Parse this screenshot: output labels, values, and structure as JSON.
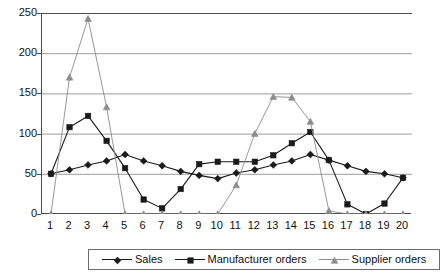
{
  "chart_data": {
    "type": "line",
    "title": "",
    "subtitle": "",
    "xlabel": "",
    "ylabel": "",
    "xlim": [
      1,
      20
    ],
    "ylim": [
      0,
      250
    ],
    "ytick_labels": [
      "0",
      "50",
      "100",
      "150",
      "200",
      "250"
    ],
    "yticks": [
      0,
      50,
      100,
      150,
      200,
      250
    ],
    "x": [
      1,
      2,
      3,
      4,
      5,
      6,
      7,
      8,
      9,
      10,
      11,
      12,
      13,
      14,
      15,
      16,
      17,
      18,
      19,
      20
    ],
    "xtick_labels": [
      "1",
      "2",
      "3",
      "4",
      "5",
      "6",
      "7",
      "8",
      "9",
      "10",
      "11",
      "12",
      "13",
      "14",
      "15",
      "16",
      "17",
      "18",
      "19",
      "20"
    ],
    "grid": "horizontal",
    "legend_position": "bottom",
    "series": [
      {
        "name": "Sales",
        "marker": "diamond",
        "color": "#1a1a1a",
        "values": [
          50,
          55,
          61,
          66,
          74,
          66,
          60,
          53,
          48,
          44,
          51,
          55,
          61,
          66,
          74,
          67,
          60,
          53,
          50,
          45
        ]
      },
      {
        "name": "Manufacturer orders",
        "marker": "square",
        "color": "#1a1a1a",
        "values": [
          50,
          108,
          122,
          91,
          57,
          18,
          7,
          31,
          62,
          65,
          65,
          65,
          73,
          88,
          102,
          67,
          12,
          0,
          13,
          45
        ]
      },
      {
        "name": "Supplier orders",
        "marker": "triangle",
        "color": "#8c8c8c",
        "values": [
          0,
          170,
          243,
          133,
          0,
          0,
          0,
          0,
          0,
          0,
          36,
          100,
          146,
          145,
          115,
          4,
          0,
          0,
          0,
          0
        ]
      }
    ]
  },
  "legend": {
    "entries": [
      {
        "label": "Sales",
        "marker": "diamond",
        "color": "#1a1a1a"
      },
      {
        "label": "Manufacturer orders",
        "marker": "square",
        "color": "#1a1a1a"
      },
      {
        "label": "Supplier orders",
        "marker": "triangle",
        "color": "#8c8c8c"
      }
    ]
  },
  "style": {
    "axis_color": "#4d4d4d",
    "grid_color": "#9d9d9d",
    "background": "#ffffff",
    "plot_background": "#ffffff"
  }
}
